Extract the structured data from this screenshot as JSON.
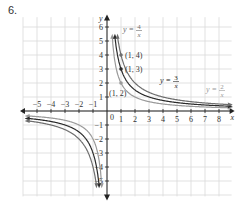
{
  "problem_number": "6.",
  "chart_data": {
    "type": "line",
    "title": "",
    "xlabel": "x",
    "ylabel": "y",
    "xlim": [
      -5.5,
      8.5
    ],
    "ylim": [
      -6.2,
      6.5
    ],
    "grid": true,
    "x_ticks": [
      -5,
      -4,
      -3,
      -2,
      -1,
      1,
      2,
      3,
      4,
      5,
      6,
      7,
      8
    ],
    "x_tick_labels": [
      "−5",
      "−4",
      "−3",
      "−2",
      "−1",
      "1",
      "2",
      "3",
      "4",
      "5",
      "6",
      "7",
      "8"
    ],
    "y_ticks": [
      6,
      5,
      4,
      3,
      2,
      1,
      -1,
      -2,
      -3,
      -4,
      -5
    ],
    "y_tick_labels": [
      "6",
      "5",
      "4",
      "3",
      "2",
      "1",
      "−1",
      "−2",
      "−3",
      "−4",
      "−5"
    ],
    "origin_label": "0",
    "series": [
      {
        "name": "y = 2/x",
        "k": 2,
        "color": "#9a9a9a",
        "label_num": "2",
        "label_den": "x",
        "point": {
          "x": 1,
          "y": 2,
          "label": "(1, 2)"
        }
      },
      {
        "name": "y = 3/x",
        "k": 3,
        "color": "#2a2a2a",
        "label_num": "3",
        "label_den": "x",
        "point": {
          "x": 1,
          "y": 3,
          "label": "(1, 3)"
        }
      },
      {
        "name": "y = 4/x",
        "k": 4,
        "color": "#6e6e6e",
        "label_num": "4",
        "label_den": "x",
        "point": {
          "x": 1,
          "y": 4,
          "label": "(1, 4)"
        }
      }
    ],
    "annotations": [
      "(1, 2)",
      "(1, 3)",
      "(1, 4)",
      "y = 4/x",
      "y = 3/x",
      "y = 2/x"
    ]
  },
  "colors": {
    "grid": "#d9d9d9",
    "axis": "#222222",
    "text": "#333333"
  }
}
